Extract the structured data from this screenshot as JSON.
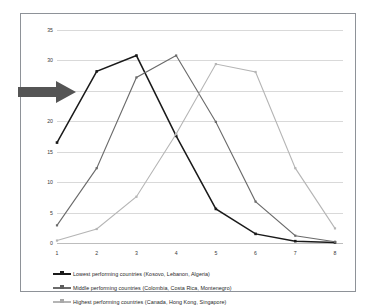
{
  "chart_data": {
    "type": "line",
    "title": "",
    "subtitle": "",
    "xlabel": "",
    "ylabel": "",
    "x": [
      1,
      2,
      3,
      4,
      5,
      6,
      7,
      8
    ],
    "xticklabels": [
      "1",
      "2",
      "3",
      "4",
      "5",
      "6",
      "7",
      "8"
    ],
    "yticklabels": [
      "0",
      "5",
      "10",
      "15",
      "20",
      "25",
      "30",
      "35"
    ],
    "ylim": [
      0,
      35
    ],
    "yticks": [
      0,
      5,
      10,
      15,
      20,
      25,
      30,
      35
    ],
    "grid": true,
    "legend_position": "bottom-left",
    "series": [
      {
        "name": "Lowest performing countries (Kosovo, Lebanon, Algeria)",
        "color": "#1a1a1a",
        "values": [
          16.5,
          28.2,
          30.8,
          17.6,
          5.6,
          1.5,
          0.3,
          0.1
        ]
      },
      {
        "name": "Middle performing countries (Colombia, Costa Rica, Montenegro)",
        "color": "#6b6b6b",
        "values": [
          2.9,
          12.3,
          27.2,
          30.8,
          19.9,
          6.8,
          1.2,
          0.2
        ]
      },
      {
        "name": "Highest performing countries (Canada, Hong Kong, Singapore)",
        "color": "#b5b5b5",
        "values": [
          0.4,
          2.3,
          7.6,
          17.9,
          29.4,
          28.1,
          12.3,
          2.4
        ]
      }
    ],
    "annotations": [
      {
        "name": "pointer-arrow",
        "shape": "right-arrow",
        "color": "#555555",
        "points_at": "Lowest performing countries (Kosovo, Lebanon, Algeria)"
      }
    ]
  },
  "legend": {
    "items": [
      {
        "label": "Lowest performing countries (Kosovo, Lebanon, Algeria)",
        "color": "#1a1a1a"
      },
      {
        "label": "Middle performing countries (Colombia, Costa Rica, Montenegro)",
        "color": "#6b6b6b"
      },
      {
        "label": "Highest performing countries (Canada, Hong Kong, Singapore)",
        "color": "#b5b5b5"
      }
    ]
  }
}
